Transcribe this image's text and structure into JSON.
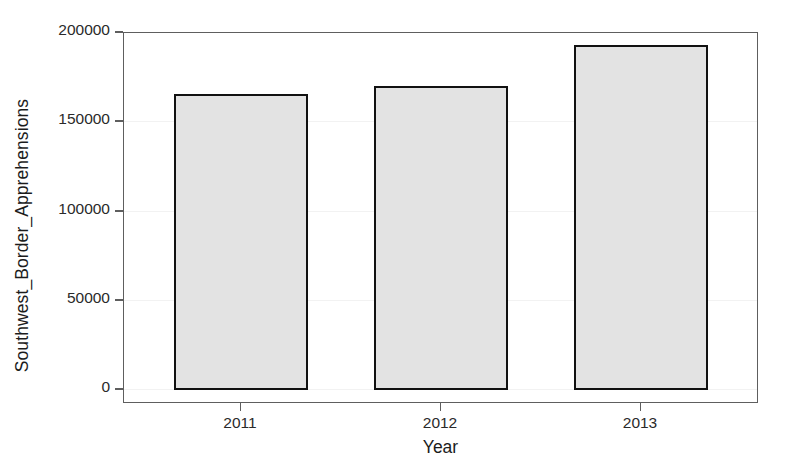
{
  "chart_data": {
    "type": "bar",
    "title": "",
    "subtitle": "",
    "xlabel": "Year",
    "ylabel": "Southwest_Border_Apprehensions",
    "categories": [
      "2011",
      "2012",
      "2013"
    ],
    "values": [
      166000,
      170500,
      193500
    ],
    "series": [
      {
        "name": "Southwest_Border_Apprehensions",
        "values": [
          166000,
          170500,
          193500
        ]
      }
    ],
    "ylim": [
      0,
      200000
    ],
    "yticks": [
      0,
      50000,
      100000,
      150000,
      200000
    ],
    "ytick_labels": [
      "0",
      "50000",
      "100000",
      "150000",
      "200000"
    ],
    "xtick_labels": [
      "2011",
      "2012",
      "2013"
    ],
    "grid": false,
    "legend": null,
    "legend_position": "none",
    "bar_fill_color": "#e3e3e3",
    "bar_edge_color": "#111111",
    "axis_color": "#5e5e5e",
    "background_color": "#ffffff"
  },
  "axes": {
    "y_title": "Southwest_Border_Apprehensions",
    "x_title": "Year",
    "y_labels": {
      "t0": "0",
      "t1": "50000",
      "t2": "100000",
      "t3": "150000",
      "t4": "200000"
    },
    "x_labels": {
      "c0": "2011",
      "c1": "2012",
      "c2": "2013"
    }
  }
}
